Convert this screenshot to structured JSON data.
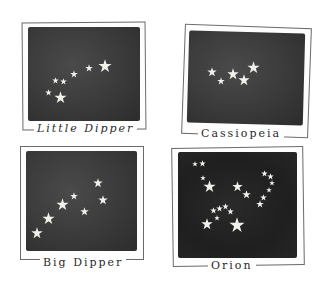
{
  "colors": {
    "sky": "#3a3a3a",
    "star": "#f2f0ea",
    "frame": "#6a6a6a",
    "paper": "#ffffff"
  },
  "cards": [
    {
      "name": "Little Dipper",
      "label": "Little Dipper",
      "stars": [
        {
          "x": 105,
          "y": 66,
          "s": 14
        },
        {
          "x": 89,
          "y": 68,
          "s": 8
        },
        {
          "x": 74,
          "y": 74,
          "s": 8
        },
        {
          "x": 63,
          "y": 81,
          "s": 7
        },
        {
          "x": 55,
          "y": 80,
          "s": 7
        },
        {
          "x": 48,
          "y": 92,
          "s": 7
        },
        {
          "x": 60,
          "y": 97,
          "s": 13
        }
      ]
    },
    {
      "name": "Cassiopeia",
      "label": "Cassiopeia",
      "stars": [
        {
          "x": 212,
          "y": 72,
          "s": 10
        },
        {
          "x": 221,
          "y": 81,
          "s": 8
        },
        {
          "x": 233,
          "y": 74,
          "s": 12
        },
        {
          "x": 244,
          "y": 80,
          "s": 12
        },
        {
          "x": 253,
          "y": 67,
          "s": 13
        }
      ]
    },
    {
      "name": "Big Dipper",
      "label": "Big Dipper",
      "stars": [
        {
          "x": 98,
          "y": 183,
          "s": 10
        },
        {
          "x": 103,
          "y": 200,
          "s": 10
        },
        {
          "x": 84,
          "y": 211,
          "s": 9
        },
        {
          "x": 74,
          "y": 196,
          "s": 8
        },
        {
          "x": 62,
          "y": 204,
          "s": 13
        },
        {
          "x": 48,
          "y": 218,
          "s": 13
        },
        {
          "x": 37,
          "y": 233,
          "s": 12
        }
      ]
    },
    {
      "name": "Orion",
      "label": "Orion",
      "stars": [
        {
          "x": 195,
          "y": 164,
          "s": 6
        },
        {
          "x": 202,
          "y": 163,
          "s": 7
        },
        {
          "x": 203,
          "y": 178,
          "s": 6
        },
        {
          "x": 209,
          "y": 186,
          "s": 13
        },
        {
          "x": 237,
          "y": 186,
          "s": 11
        },
        {
          "x": 246,
          "y": 194,
          "s": 9
        },
        {
          "x": 264,
          "y": 173,
          "s": 7
        },
        {
          "x": 270,
          "y": 176,
          "s": 7
        },
        {
          "x": 272,
          "y": 183,
          "s": 6
        },
        {
          "x": 269,
          "y": 190,
          "s": 6
        },
        {
          "x": 263,
          "y": 197,
          "s": 7
        },
        {
          "x": 260,
          "y": 204,
          "s": 8
        },
        {
          "x": 213,
          "y": 210,
          "s": 7
        },
        {
          "x": 219,
          "y": 208,
          "s": 7
        },
        {
          "x": 225,
          "y": 206,
          "s": 7
        },
        {
          "x": 230,
          "y": 211,
          "s": 7
        },
        {
          "x": 217,
          "y": 218,
          "s": 6
        },
        {
          "x": 207,
          "y": 224,
          "s": 12
        },
        {
          "x": 237,
          "y": 225,
          "s": 16
        }
      ]
    }
  ]
}
